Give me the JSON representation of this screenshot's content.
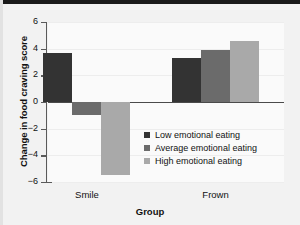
{
  "chart_data": {
    "type": "bar",
    "title": "",
    "subtitle": "",
    "xlabel": "Group",
    "ylabel": "Change in food craving score",
    "categories": [
      "Smile",
      "Frown"
    ],
    "series": [
      {
        "name": "Low emotional eating",
        "values": [
          3.7,
          3.3
        ],
        "color": "#333333"
      },
      {
        "name": "Average emotional eating",
        "values": [
          -1.0,
          3.9
        ],
        "color": "#6b6b6b"
      },
      {
        "name": "High emotional eating",
        "values": [
          -5.5,
          4.6
        ],
        "color": "#a9a9a9"
      }
    ],
    "ylim": [
      -6,
      6
    ],
    "ytick_labels": [
      "6",
      "4",
      "2",
      "0",
      "−2",
      "−4",
      "−6"
    ],
    "ytick_values": [
      6,
      4,
      2,
      0,
      -2,
      -4,
      -6
    ],
    "grid": true,
    "legend_position": "center-right-inside",
    "zero_line": 0
  },
  "figure": {
    "background_color": "#f2f2f2",
    "plot_background_color": "#fafafa",
    "axis_color": "#5a5a5a"
  }
}
